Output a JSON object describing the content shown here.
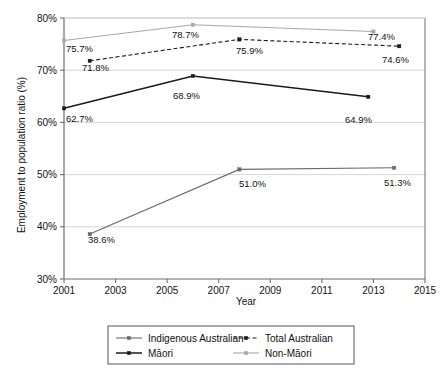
{
  "chart_data": {
    "type": "line",
    "title": "",
    "xlabel": "Year",
    "ylabel": "Employment to population ratio (%)",
    "xlim": [
      2001,
      2015
    ],
    "ylim": [
      30,
      80
    ],
    "grid": true,
    "legend_position": "bottom",
    "x_ticks": [
      "2001",
      "2003",
      "2005",
      "2007",
      "2009",
      "2011",
      "2013",
      "2015"
    ],
    "x_tick_values": [
      2001,
      2003,
      2005,
      2007,
      2009,
      2011,
      2013,
      2015
    ],
    "y_ticks": [
      "30%",
      "40%",
      "50%",
      "60%",
      "70%",
      "80%"
    ],
    "y_tick_values": [
      30,
      40,
      50,
      60,
      70,
      80
    ],
    "series": [
      {
        "name": "Indigenous Australian",
        "color": "#6b6b6b",
        "style": "solid",
        "points": [
          {
            "x": 2002.0,
            "y": 38.6,
            "label": "38.6%"
          },
          {
            "x": 2007.8,
            "y": 51.0,
            "label": "51.0%"
          },
          {
            "x": 2013.8,
            "y": 51.3,
            "label": "51.3%"
          }
        ]
      },
      {
        "name": "Total Australian",
        "color": "#1a1a1a",
        "style": "dashed",
        "points": [
          {
            "x": 2002.0,
            "y": 71.8,
            "label": "71.8%"
          },
          {
            "x": 2007.8,
            "y": 75.9,
            "label": "75.9%"
          },
          {
            "x": 2014.0,
            "y": 74.6,
            "label": "74.6%"
          }
        ]
      },
      {
        "name": "Māori",
        "color": "#1a1a1a",
        "style": "solid",
        "points": [
          {
            "x": 2001.0,
            "y": 62.7,
            "label": "62.7%"
          },
          {
            "x": 2006.0,
            "y": 68.9,
            "label": "68.9%"
          },
          {
            "x": 2012.8,
            "y": 64.9,
            "label": "64.9%"
          }
        ]
      },
      {
        "name": "Non-Māori",
        "color": "#a8a8a8",
        "style": "solid",
        "points": [
          {
            "x": 2001.0,
            "y": 75.7,
            "label": "75.7%"
          },
          {
            "x": 2006.0,
            "y": 78.7,
            "label": "78.7%"
          },
          {
            "x": 2013.0,
            "y": 77.4,
            "label": "77.4%"
          }
        ]
      }
    ],
    "point_labels": [
      {
        "series": "Non-Māori",
        "text": "75.7%",
        "x": 66,
        "y": 52
      },
      {
        "series": "Total Australian",
        "text": "71.8%",
        "x": 82,
        "y": 71
      },
      {
        "series": "Māori",
        "text": "62.7%",
        "x": 66,
        "y": 122
      },
      {
        "series": "Indigenous Australian",
        "text": "38.6%",
        "x": 88,
        "y": 243
      },
      {
        "series": "Non-Māori",
        "text": "78.7%",
        "x": 172,
        "y": 38
      },
      {
        "series": "Māori",
        "text": "68.9%",
        "x": 173,
        "y": 99
      },
      {
        "series": "Total Australian",
        "text": "75.9%",
        "x": 236,
        "y": 54
      },
      {
        "series": "Indigenous Australian",
        "text": "51.0%",
        "x": 239,
        "y": 187
      },
      {
        "series": "Non-Māori",
        "text": "77.4%",
        "x": 368,
        "y": 40
      },
      {
        "series": "Total Australian",
        "text": "74.6%",
        "x": 382,
        "y": 63
      },
      {
        "series": "Māori",
        "text": "64.9%",
        "x": 345,
        "y": 123
      },
      {
        "series": "Indigenous Australian",
        "text": "51.3%",
        "x": 384,
        "y": 186
      }
    ]
  },
  "legend": {
    "entries": [
      {
        "label": "Indigenous Australian",
        "color": "#6b6b6b",
        "style": "solid"
      },
      {
        "label": "Total Australian",
        "color": "#1a1a1a",
        "style": "dashed"
      },
      {
        "label": "Māori",
        "color": "#1a1a1a",
        "style": "solid"
      },
      {
        "label": "Non-Māori",
        "color": "#a8a8a8",
        "style": "solid"
      }
    ]
  },
  "axes": {
    "x_title": "Year",
    "y_title": "Employment to population ratio (%)"
  }
}
